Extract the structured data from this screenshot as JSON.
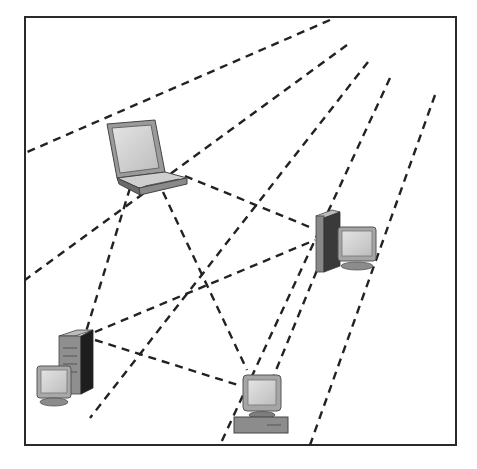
{
  "diagram": {
    "type": "wireless-ad-hoc-network",
    "frame": {
      "x": 25,
      "y": 17,
      "width": 431,
      "height": 428,
      "stroke": "#2a2a2a"
    },
    "colors": {
      "dash": "#222222",
      "device_light": "#d6d6d6",
      "device_mid": "#a8a8a8",
      "device_dark": "#5a5a5a",
      "device_black": "#1e1e1e"
    },
    "nodes": [
      {
        "id": "laptop",
        "label": "laptop-icon",
        "x": 105,
        "y": 120
      },
      {
        "id": "server-right",
        "label": "workstation-icon",
        "x": 312,
        "y": 210
      },
      {
        "id": "server-left",
        "label": "workstation-icon",
        "x": 35,
        "y": 330
      },
      {
        "id": "desktop",
        "label": "desktop-computer-icon",
        "x": 233,
        "y": 375
      }
    ],
    "signal_lines": [
      {
        "x1": 330,
        "y1": 20,
        "x2": 25,
        "y2": 153
      },
      {
        "x1": 347,
        "y1": 45,
        "x2": 25,
        "y2": 280
      },
      {
        "x1": 368,
        "y1": 62,
        "x2": 90,
        "y2": 418
      },
      {
        "x1": 390,
        "y1": 78,
        "x2": 220,
        "y2": 445
      },
      {
        "x1": 435,
        "y1": 95,
        "x2": 310,
        "y2": 445
      }
    ],
    "links": [
      {
        "from": "laptop",
        "to": "server-right",
        "x1": 185,
        "y1": 176,
        "x2": 312,
        "y2": 228
      },
      {
        "from": "laptop",
        "to": "server-left",
        "x1": 130,
        "y1": 188,
        "x2": 85,
        "y2": 335
      },
      {
        "from": "laptop",
        "to": "desktop",
        "x1": 163,
        "y1": 192,
        "x2": 247,
        "y2": 370
      },
      {
        "from": "server-left",
        "to": "server-right",
        "x1": 95,
        "y1": 332,
        "x2": 315,
        "y2": 240
      },
      {
        "from": "server-left",
        "to": "desktop",
        "x1": 95,
        "y1": 340,
        "x2": 238,
        "y2": 385
      },
      {
        "from": "server-right",
        "to": "desktop",
        "x1": 322,
        "y1": 258,
        "x2": 272,
        "y2": 380
      }
    ]
  },
  "caption": {
    "text": "",
    "note": "faint illegible figure caption below frame"
  }
}
